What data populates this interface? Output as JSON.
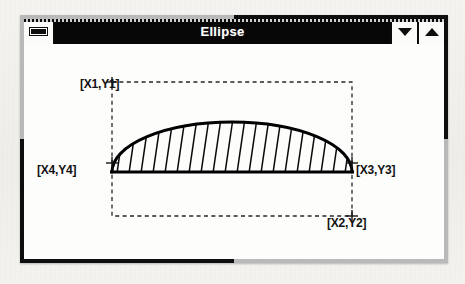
{
  "window": {
    "title": "Ellipse",
    "system_menu_icon": "minimize-bar-icon",
    "minimize_icon": "triangle-down-icon",
    "maximize_icon": "triangle-up-icon"
  },
  "diagram": {
    "name": "ellipse-construction-diagram",
    "shape": {
      "type": "half-ellipse",
      "hatch_line_count": 20,
      "hatch_angle_deg": 8,
      "outline_color": "#000000",
      "fill": "hatched"
    },
    "bounding_box": {
      "style": "dashed",
      "color": "#222222",
      "left": 108,
      "top": 63,
      "right": 348,
      "bottom": 197
    },
    "points": [
      {
        "id": "p1",
        "label": "[X1,Y1]",
        "marker": "corner",
        "anchor": "top-left"
      },
      {
        "id": "p2",
        "label": "[X2,Y2]",
        "marker": "plus",
        "anchor": "bottom-right"
      },
      {
        "id": "p3",
        "label": "[X3,Y3]",
        "marker": "plus",
        "anchor": "right-mid"
      },
      {
        "id": "p4",
        "label": "[X4,Y4]",
        "marker": "plus",
        "anchor": "left-mid"
      }
    ]
  }
}
